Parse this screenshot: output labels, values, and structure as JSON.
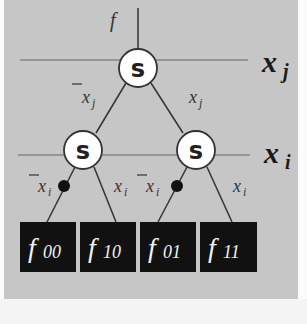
{
  "diagram": {
    "type": "BDD / Shannon expansion tree",
    "colors": {
      "background": "#c6c6c6",
      "node_fill": "#ffffff",
      "leaf_fill": "#111111",
      "line": "#444444"
    },
    "root_label": "f",
    "levels": [
      {
        "variable": "x",
        "subscript": "j"
      },
      {
        "variable": "x",
        "subscript": "i"
      }
    ],
    "nodes": [
      {
        "id": "root",
        "label": "s"
      },
      {
        "id": "left",
        "label": "s"
      },
      {
        "id": "right",
        "label": "s"
      }
    ],
    "edges": {
      "root_left": {
        "var": "x",
        "sub": "j",
        "negated": true
      },
      "root_right": {
        "var": "x",
        "sub": "j",
        "negated": false
      },
      "left_left": {
        "var": "x",
        "sub": "i",
        "negated": true
      },
      "left_right": {
        "var": "x",
        "sub": "i",
        "negated": false
      },
      "right_left": {
        "var": "x",
        "sub": "i",
        "negated": true
      },
      "right_right": {
        "var": "x",
        "sub": "i",
        "negated": false
      }
    },
    "leaves": [
      {
        "f": "f",
        "sub": "00"
      },
      {
        "f": "f",
        "sub": "10"
      },
      {
        "f": "f",
        "sub": "01"
      },
      {
        "f": "f",
        "sub": "11"
      }
    ]
  }
}
